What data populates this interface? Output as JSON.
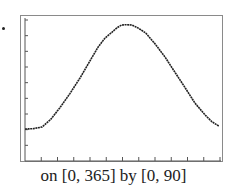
{
  "caption": "on [0, 365] by [0, 90]",
  "chart_data": {
    "type": "line",
    "title": "",
    "xlabel": "",
    "ylabel": "",
    "xlim": [
      0,
      365
    ],
    "ylim": [
      0,
      90
    ],
    "x_ticks_count": 12,
    "y_ticks_count": 9,
    "grid": false,
    "legend": null,
    "series": [
      {
        "name": "curve",
        "color": "#222222",
        "x": [
          0,
          15,
          32,
          48,
          65,
          84,
          103,
          120,
          137,
          150,
          163,
          172,
          181,
          190,
          200,
          212,
          226,
          243,
          262,
          281,
          300,
          318,
          337,
          350,
          363
        ],
        "y": [
          20.4,
          20.6,
          21.7,
          26.5,
          33.8,
          43.0,
          53.0,
          63.0,
          72.8,
          78.5,
          82.3,
          85.0,
          86.8,
          87.0,
          86.8,
          84.8,
          81.7,
          75.0,
          66.4,
          56.5,
          46.6,
          37.0,
          29.4,
          25.0,
          22.3
        ]
      }
    ]
  }
}
